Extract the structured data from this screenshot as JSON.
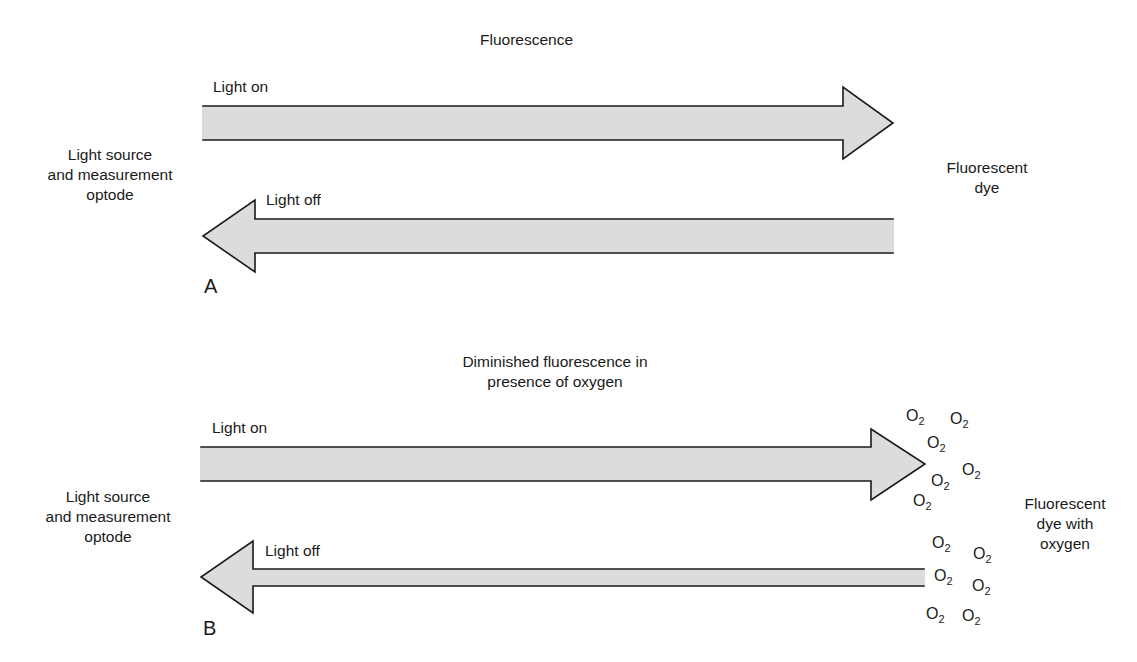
{
  "panel_a": {
    "letter": "A",
    "title": "Fluorescence",
    "left_label": [
      "Light source",
      "and measurement",
      "optode"
    ],
    "right_label": [
      "Fluorescent",
      "dye"
    ],
    "arrow_on_label": "Light on",
    "arrow_off_label": "Light off"
  },
  "panel_b": {
    "letter": "B",
    "title": [
      "Diminished fluorescence in",
      "presence of oxygen"
    ],
    "left_label": [
      "Light source",
      "and measurement",
      "optode"
    ],
    "right_label": [
      "Fluorescent",
      "dye with",
      "oxygen"
    ],
    "arrow_on_label": "Light on",
    "arrow_off_label": "Light off",
    "oxygen_symbol": "O",
    "oxygen_subscript": "2"
  },
  "colors": {
    "arrow_fill": "#dcdcdc",
    "arrow_stroke": "#1a1a1a",
    "text": "#1a1a1a"
  }
}
